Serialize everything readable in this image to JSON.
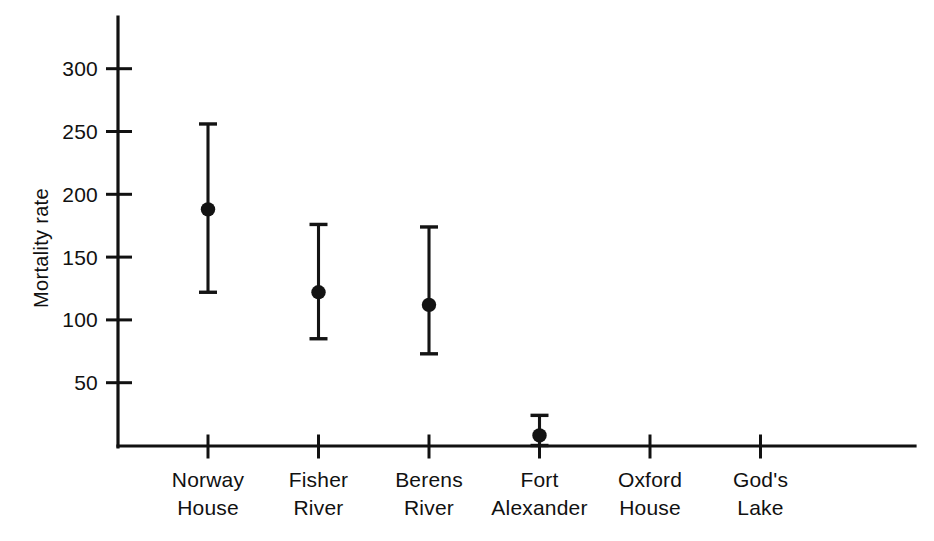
{
  "chart_data": {
    "type": "scatter",
    "title": "",
    "subtitle": "",
    "xlabel": "",
    "ylabel": "Mortality rate",
    "categories": [
      "Norway House",
      "Fisher River",
      "Berens River",
      "Fort Alexander",
      "Oxford House",
      "God's Lake"
    ],
    "category_lines": [
      [
        "Norway",
        "House"
      ],
      [
        "Fisher",
        "River"
      ],
      [
        "Berens",
        "River"
      ],
      [
        "Fort",
        "Alexander"
      ],
      [
        "Oxford",
        "House"
      ],
      [
        "God's",
        "Lake"
      ]
    ],
    "values": [
      188,
      122,
      112,
      8,
      null,
      null
    ],
    "error_low": [
      122,
      85,
      73,
      0,
      null,
      null
    ],
    "error_high": [
      256,
      176,
      174,
      24,
      null,
      null
    ],
    "points": [
      {
        "category": "Norway House",
        "value": 188,
        "low": 122,
        "high": 256,
        "has_data": true
      },
      {
        "category": "Fisher River",
        "value": 122,
        "low": 85,
        "high": 176,
        "has_data": true
      },
      {
        "category": "Berens River",
        "value": 112,
        "low": 73,
        "high": 174,
        "has_data": true
      },
      {
        "category": "Fort Alexander",
        "value": 8,
        "low": 0,
        "high": 24,
        "has_data": true
      },
      {
        "category": "Oxford House",
        "value": null,
        "low": null,
        "high": null,
        "has_data": false
      },
      {
        "category": "God's Lake",
        "value": null,
        "low": null,
        "high": null,
        "has_data": false
      }
    ],
    "ylim": [
      0,
      320
    ],
    "yticks": [
      50,
      100,
      150,
      200,
      250,
      300
    ],
    "ytick_labels": [
      "50",
      "100",
      "150",
      "200",
      "250",
      "300"
    ],
    "grid": false,
    "legend": null,
    "marker": "filled-circle",
    "error_bar_style": "capped-vertical",
    "colors": {
      "ink": "#111111",
      "marker": "#131313",
      "background": "#ffffff"
    }
  }
}
